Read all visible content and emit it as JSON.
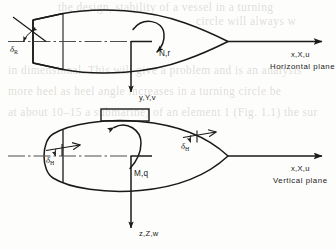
{
  "figure": {
    "background_color": "#fdfdfc",
    "line_color": "#1a1a1a"
  },
  "horizontal_view": {
    "name": "Horizontal plane view (plan view)",
    "plane_label": "Horizontal plane",
    "surge_axis_label": "x,X,u",
    "sway_axis_label": "y,Y,v",
    "moment_label": "N,r",
    "rudder_label_symbol": "δ",
    "rudder_label_subscript": "R"
  },
  "vertical_view": {
    "name": "Vertical plane view (side view)",
    "plane_label": "Vertical plane",
    "surge_axis_label": "x,X,u",
    "heave_axis_label": "z,Z,w",
    "moment_label": "M,q",
    "bow_plane_symbol": "δ",
    "bow_plane_subscript": "H",
    "stern_plane_symbol": "δ",
    "stern_plane_subscript": "H"
  },
  "background_bleed": [
    "the design, stability of a vessel in a turning",
    "circle will always w",
    "in dimensional. This will give a problem and is an analysis",
    "more  heel as heel angle increases in a turning circle be",
    "at about 10–15 a submarine) of an element 1 (Fig. 1.1) the sur"
  ]
}
